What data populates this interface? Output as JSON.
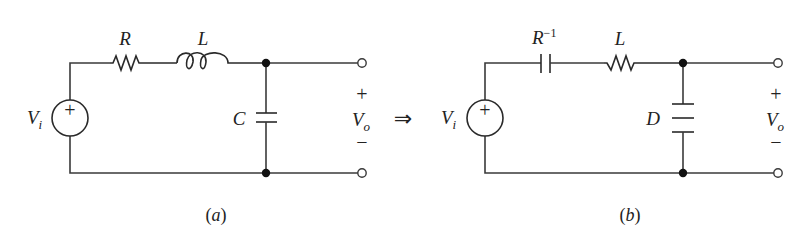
{
  "figure": {
    "arrow_symbol": "⇒",
    "circuit_a": {
      "caption": "(a)",
      "source_label": "V",
      "source_subscript": "i",
      "source_polarity": "+",
      "series_element_1_label": "R",
      "series_element_1_type": "resistor",
      "series_element_2_label": "L",
      "series_element_2_type": "inductor",
      "shunt_element_label": "C",
      "shunt_element_type": "capacitor",
      "output_label": "V",
      "output_subscript": "o",
      "output_plus": "+",
      "output_minus": "−"
    },
    "circuit_b": {
      "caption": "(b)",
      "source_label": "V",
      "source_subscript": "i",
      "source_polarity": "+",
      "series_element_1_label": "R",
      "series_element_1_superscript": "−1",
      "series_element_1_type": "capacitor",
      "series_element_2_label": "L",
      "series_element_2_type": "resistor",
      "shunt_element_label": "D",
      "shunt_element_type": "FDNR (three-plate)",
      "output_label": "V",
      "output_subscript": "o",
      "output_plus": "+",
      "output_minus": "−"
    }
  }
}
